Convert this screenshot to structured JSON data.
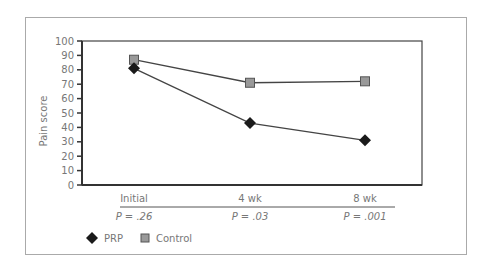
{
  "chart_data": {
    "type": "line",
    "title": "",
    "xlabel": "",
    "ylabel": "Pain score",
    "ylim": [
      0,
      100
    ],
    "yticks": [
      0,
      10,
      20,
      30,
      40,
      50,
      60,
      70,
      80,
      90,
      100
    ],
    "categories": [
      "Initial",
      "4 wk",
      "8 wk"
    ],
    "p_values": [
      "P = .26",
      "P = .03",
      "P = .001"
    ],
    "series": [
      {
        "name": "PRP",
        "marker": "diamond",
        "color": "#1a1a1a",
        "values": [
          81,
          43,
          31
        ]
      },
      {
        "name": "Control",
        "marker": "square",
        "color": "#999999",
        "values": [
          87,
          71,
          72
        ]
      }
    ],
    "grid": false,
    "legend_position": "bottom-left"
  },
  "legend": {
    "items": [
      {
        "label": "PRP",
        "marker": "diamond"
      },
      {
        "label": "Control",
        "marker": "square"
      }
    ]
  }
}
